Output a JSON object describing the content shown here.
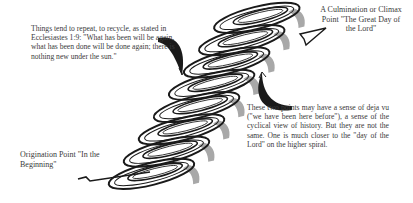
{
  "diagram": {
    "type": "ascending spiral",
    "coil_count": 8,
    "colors": {
      "line": "#1a1a1a",
      "shadow": "#a8a8a8",
      "text": "#3a3a3a",
      "background": "#ffffff"
    }
  },
  "labels": {
    "quote": "Things tend to repeat, to recycle, as stated in Ecclesiastes 1:9: \"What has been will be again, what has been done will be done again; there is nothing new under the sun.\"",
    "culmination": "A Culmination or Climax Point \"The Great Day of the Lord\"",
    "deja_vu": "These two points may have a sense of deja vu (\"we have been here before\"), a sense of the cyclical view of history. But they are not the same. One is much closer to the \"day of the Lord\" on the higher spiral.",
    "origination": "Origination Point \"In the Beginning\""
  },
  "arrows": [
    {
      "name": "quote-pointer-arrow",
      "from": "quote",
      "to": "lower coils"
    },
    {
      "name": "deja-vu-pointer-arrow",
      "from": "deja_vu",
      "to": "upper coils"
    },
    {
      "name": "culmination-arrowhead",
      "at": "spiral end"
    }
  ]
}
